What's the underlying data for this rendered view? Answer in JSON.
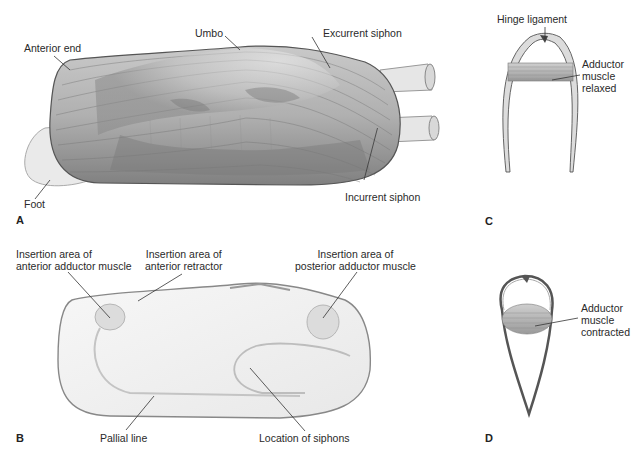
{
  "figure": {
    "panels": {
      "A": {
        "letter": "A",
        "labels": {
          "anterior_end": "Anterior end",
          "umbo": "Umbo",
          "excurrent_siphon": "Excurrent siphon",
          "incurrent_siphon": "Incurrent siphon",
          "foot": "Foot"
        }
      },
      "B": {
        "letter": "B",
        "labels": {
          "anterior_adductor": "Insertion area of\nanterior adductor muscle",
          "anterior_retractor": "Insertion area of\nanterior retractor",
          "posterior_adductor": "Insertion area of\nposterior adductor muscle",
          "pallial_line": "Pallial line",
          "siphons_location": "Location of siphons"
        }
      },
      "C": {
        "letter": "C",
        "labels": {
          "hinge_ligament": "Hinge ligament",
          "adductor_relaxed": "Adductor\nmuscle\nrelaxed"
        }
      },
      "D": {
        "letter": "D",
        "labels": {
          "adductor_contracted": "Adductor\nmuscle\ncontracted"
        }
      }
    },
    "colors": {
      "shell_dark": "#6e6e6e",
      "shell_mid": "#9a9a9a",
      "shell_light": "#d4d4d4",
      "interior": "#f2f2f2",
      "leader_line": "#333333"
    }
  }
}
